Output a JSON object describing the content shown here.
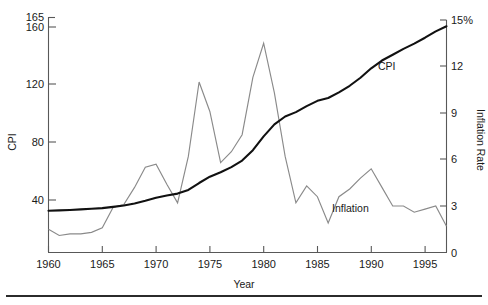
{
  "chart_data": {
    "type": "line",
    "title": "",
    "xlabel": "Year",
    "ylabel": "CPI",
    "y2label": "Inflation Rate",
    "xlim": [
      1960,
      1997
    ],
    "ylim": [
      0,
      165
    ],
    "y2lim": [
      0,
      15
    ],
    "grid": false,
    "legend": "inline-annotations",
    "x_ticks": [
      "1960",
      "1965",
      "1970",
      "1975",
      "1980",
      "1985",
      "1990",
      "1995"
    ],
    "x_tick_values": [
      1960,
      1965,
      1970,
      1975,
      1980,
      1985,
      1990,
      1995
    ],
    "y_ticks": [
      "165",
      "160",
      "120",
      "80",
      "40"
    ],
    "y_tick_values": [
      165,
      160,
      120,
      80,
      40
    ],
    "y2_ticks": [
      "15%",
      "12",
      "9",
      "6",
      "3",
      "0"
    ],
    "y2_tick_values": [
      15,
      12,
      9,
      6,
      3,
      0
    ],
    "annotations": [
      {
        "text": "CPI",
        "x": 1988.5,
        "y_axis": "left",
        "value": 131
      },
      {
        "text": "Inflation",
        "x": 1987.2,
        "y_axis": "right",
        "value": 3.6
      }
    ],
    "x": [
      1960,
      1961,
      1962,
      1963,
      1964,
      1965,
      1966,
      1967,
      1968,
      1969,
      1970,
      1971,
      1972,
      1973,
      1974,
      1975,
      1976,
      1977,
      1978,
      1979,
      1980,
      1981,
      1982,
      1983,
      1984,
      1985,
      1986,
      1987,
      1988,
      1989,
      1990,
      1991,
      1992,
      1993,
      1994,
      1995,
      1996,
      1997
    ],
    "series": [
      {
        "name": "CPI",
        "axis": "left",
        "color": "#111111",
        "values": [
          29.6,
          29.9,
          30.2,
          30.6,
          31.0,
          31.5,
          32.4,
          33.4,
          34.8,
          36.7,
          38.8,
          40.5,
          41.8,
          44.4,
          49.3,
          53.8,
          56.9,
          60.6,
          65.2,
          72.6,
          82.4,
          90.9,
          96.5,
          99.6,
          103.9,
          107.6,
          109.6,
          113.6,
          118.3,
          124.0,
          130.7,
          136.2,
          140.3,
          144.5,
          148.2,
          152.4,
          156.9,
          160.5
        ]
      },
      {
        "name": "Inflation",
        "axis": "right",
        "color": "#8a8a8a",
        "values": [
          1.5,
          1.1,
          1.2,
          1.2,
          1.3,
          1.6,
          2.9,
          3.1,
          4.2,
          5.5,
          5.7,
          4.4,
          3.2,
          6.2,
          11.0,
          9.1,
          5.8,
          6.5,
          7.6,
          11.3,
          13.5,
          10.3,
          6.2,
          3.2,
          4.3,
          3.6,
          1.9,
          3.6,
          4.1,
          4.8,
          5.4,
          4.2,
          3.0,
          3.0,
          2.6,
          2.8,
          3.0,
          1.7
        ]
      }
    ]
  },
  "axes": {
    "x_title": "Year",
    "y_left_title": "CPI",
    "y_right_title": "Inflation Rate"
  },
  "labels": {
    "cpi": "CPI",
    "inflation": "Inflation"
  }
}
